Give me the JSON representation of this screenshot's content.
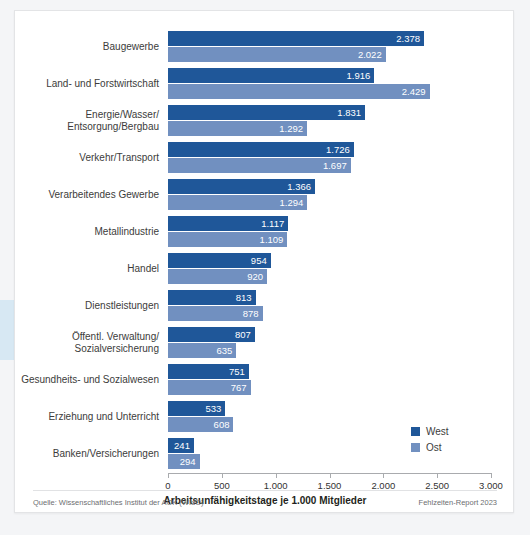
{
  "legend": {
    "position": "bottom-right",
    "items": [
      {
        "label": "West",
        "color": "#1f5799"
      },
      {
        "label": "Ost",
        "color": "#7190c0"
      }
    ]
  },
  "footer": {
    "source": "Quelle: Wissenschaftliches Institut der AOK (WIdO)",
    "report": "Fehlzeiten-Report 2023"
  },
  "chart_data": {
    "type": "bar",
    "orientation": "horizontal",
    "title": "",
    "xlabel": "Arbeitsunfähigkeitstage je 1.000 Mitglieder",
    "ylabel": "",
    "xlim": [
      0,
      3000
    ],
    "grid": false,
    "tick_labels": [
      "0",
      "500",
      "1.000",
      "1.500",
      "2.000",
      "2.500",
      "3.000"
    ],
    "ticks": [
      0,
      500,
      1000,
      1500,
      2000,
      2500,
      3000
    ],
    "categories": [
      "Baugewerbe",
      "Land- und Forstwirtschaft",
      "Energie/Wasser/\nEntsorgung/Bergbau",
      "Verkehr/Transport",
      "Verarbeitendes Gewerbe",
      "Metallindustrie",
      "Handel",
      "Dienstleistungen",
      "Öffentl. Verwaltung/\nSozialversicherung",
      "Gesundheits- und Sozialwesen",
      "Erziehung und Unterricht",
      "Banken/Versicherungen"
    ],
    "series": [
      {
        "name": "West",
        "color": "#1f5799",
        "values": [
          2378,
          1916,
          1831,
          1726,
          1366,
          1117,
          954,
          813,
          807,
          751,
          533,
          241
        ],
        "labels": [
          "2.378",
          "1.916",
          "1.831",
          "1.726",
          "1.366",
          "1.117",
          "954",
          "813",
          "807",
          "751",
          "533",
          "241"
        ]
      },
      {
        "name": "Ost",
        "color": "#7190c0",
        "values": [
          2022,
          2429,
          1292,
          1697,
          1294,
          1109,
          920,
          878,
          635,
          767,
          608,
          294
        ],
        "labels": [
          "2.022",
          "2.429",
          "1.292",
          "1.697",
          "1.294",
          "1.109",
          "920",
          "878",
          "635",
          "767",
          "608",
          "294"
        ]
      }
    ]
  }
}
